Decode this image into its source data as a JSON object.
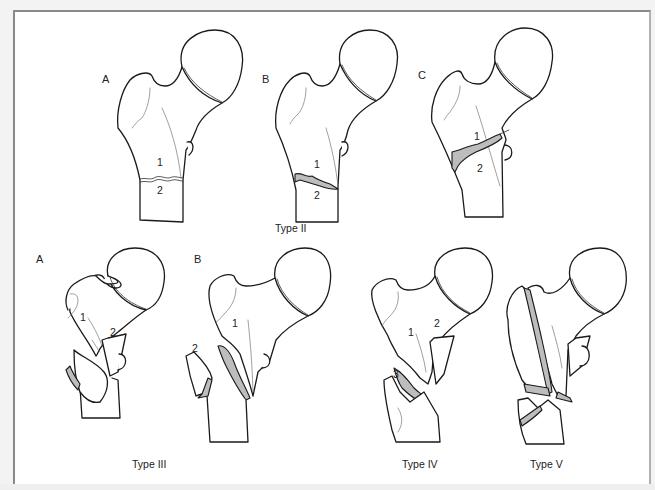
{
  "figure": {
    "rows": [
      {
        "caption": "Type II",
        "panels": [
          {
            "letter": "A",
            "fragments": [
              "1",
              "2"
            ]
          },
          {
            "letter": "B",
            "fragments": [
              "1",
              "2"
            ]
          },
          {
            "letter": "C",
            "fragments": [
              "1",
              "2"
            ]
          }
        ]
      },
      {
        "groups": [
          {
            "caption": "Type III",
            "panels": [
              {
                "letter": "A",
                "fragments": [
                  "1",
                  "2"
                ]
              },
              {
                "letter": "B",
                "fragments": [
                  "1",
                  "2"
                ]
              }
            ]
          },
          {
            "caption": "Type IV",
            "panels": [
              {
                "letter": "",
                "fragments": [
                  "1",
                  "2",
                  "3"
                ]
              }
            ]
          },
          {
            "caption": "Type V",
            "panels": [
              {
                "letter": "",
                "fragments": []
              }
            ]
          }
        ]
      }
    ]
  },
  "colors": {
    "line": "#1a1a1a",
    "fracture_fill": "#bdbdbd",
    "frame": "#8a8a8a",
    "background": "#ffffff"
  }
}
